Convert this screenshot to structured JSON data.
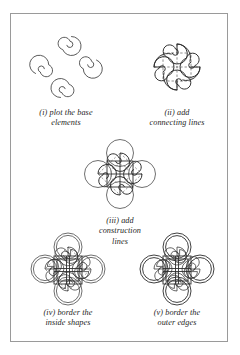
{
  "page": {
    "background_color": "#ffffff",
    "frame_color": "#9a9a9a",
    "ink_color": "#2f2f2f"
  },
  "figures": [
    {
      "id": "step-1",
      "numeral": "(i)",
      "caption_lines": [
        "(i) plot the base",
        "elements"
      ],
      "caption_text": "(i) plot the base elements",
      "elements": "four open spirals arranged in a pinwheel",
      "spiral_count": 4,
      "has_connecting_curves": false,
      "has_dashed_grid": false,
      "has_construction_circles": false,
      "has_border_lines": false
    },
    {
      "id": "step-2",
      "numeral": "(ii)",
      "caption_lines": [
        "(ii) add",
        "connecting lines"
      ],
      "caption_text": "(ii) add connecting lines",
      "elements": "spirals joined by sweeping curves over a dashed square grid",
      "spiral_count": 4,
      "has_connecting_curves": true,
      "has_dashed_grid": true,
      "has_construction_circles": false,
      "has_border_lines": false
    },
    {
      "id": "step-3",
      "numeral": "(iii)",
      "caption_lines": [
        "(iii) add",
        "construction",
        "lines"
      ],
      "caption_text": "(iii) add construction lines",
      "elements": "four construction circles, solid inner square and dashed guides",
      "spiral_count": 4,
      "has_connecting_curves": true,
      "has_dashed_grid": true,
      "has_construction_circles": true,
      "has_border_lines": false
    },
    {
      "id": "step-4",
      "numeral": "(iv)",
      "caption_lines": [
        "(iv) border the",
        "inside shapes"
      ],
      "caption_text": "(iv) border the inside shapes",
      "elements": "inner shapes doubled into bands, construction circles still visible",
      "spiral_count": 4,
      "has_connecting_curves": true,
      "has_dashed_grid": true,
      "has_construction_circles": true,
      "has_border_lines": true
    },
    {
      "id": "step-5",
      "numeral": "(v)",
      "caption_lines": [
        "(v) border the",
        "outer edges"
      ],
      "caption_text": "(v) border the outer edges",
      "elements": "finished knot with all outer edges outlined, construction lines removed",
      "spiral_count": 4,
      "has_connecting_curves": true,
      "has_dashed_grid": false,
      "has_construction_circles": false,
      "has_border_lines": true
    }
  ]
}
